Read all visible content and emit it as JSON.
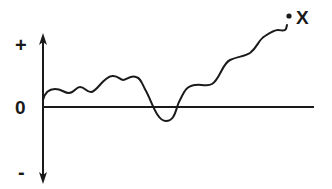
{
  "diagram": {
    "axis_labels": {
      "positive": "+",
      "zero": "0",
      "negative": "-"
    },
    "endpoint_label": "X",
    "colors": {
      "stroke": "#1a1a1a",
      "background": "#ffffff"
    }
  }
}
